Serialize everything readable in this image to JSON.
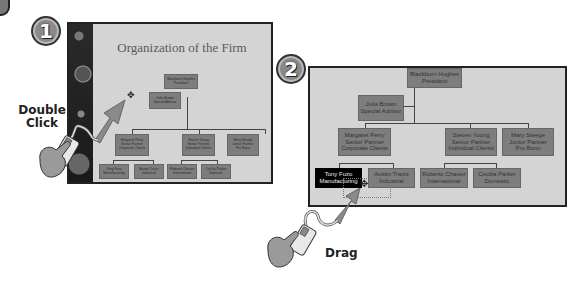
{
  "steps": [
    {
      "number": "1",
      "action_label_line1": "Double",
      "action_label_line2": "Click",
      "slide": {
        "title": "Organization of the Firm",
        "boxes": {
          "president": [
            "Blackburn Hughes",
            "President"
          ],
          "advisor": [
            "Julia Brown",
            "Special Advisor"
          ],
          "perry": [
            "Margaret Perry",
            "Senior Partner",
            "Corporate Clients"
          ],
          "young": [
            "Steven Young",
            "Senior Partner",
            "Individual Clients"
          ],
          "steege": [
            "Mary Steege",
            "Junior Partner",
            "Pro Bono"
          ],
          "fuzo": [
            "Tony Fuzo",
            "Manufacturing"
          ],
          "travis": [
            "Austin Travis",
            "Industrial"
          ],
          "chavez": [
            "Roberto Chavez",
            "International"
          ],
          "parker": [
            "Cecilia Parker",
            "Domestic"
          ]
        }
      }
    },
    {
      "number": "2",
      "action_label": "Drag",
      "slide": {
        "selected_box": "fuzo",
        "boxes": {
          "president": [
            "Blackburn Hughes",
            "President"
          ],
          "advisor": [
            "Julia Brown",
            "Special Advisor"
          ],
          "perry": [
            "Margaret Perry",
            "Senior Partner",
            "Corporate Clients"
          ],
          "young": [
            "Steven Young",
            "Senior Partner",
            "Individual Clients"
          ],
          "steege": [
            "Mary Steege",
            "Junior Partner",
            "Pro Bono"
          ],
          "fuzo": [
            "Tony Fuzo",
            "Manufacturing"
          ],
          "travis": [
            "Austin Travis",
            "Industrial"
          ],
          "chavez": [
            "Roberto Chavez",
            "International"
          ],
          "parker": [
            "Cecilia Parker",
            "Domestic"
          ]
        }
      }
    }
  ],
  "colors": {
    "slide_bg": "#d4d4d4",
    "box_fill": "#7d7d7d",
    "selected_box_fill": "#000000",
    "arrow": "#8a8a8a"
  }
}
